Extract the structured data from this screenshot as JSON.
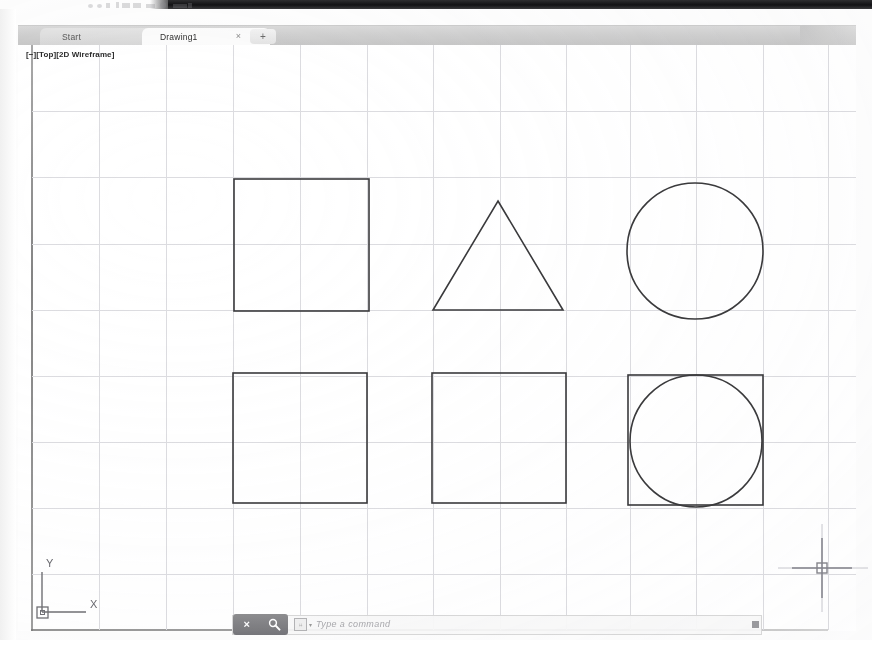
{
  "app": {
    "name": "AutoCAD",
    "viewport_label": "[−][Top][2D Wireframe]"
  },
  "tabs": {
    "start_label": "Start",
    "drawing_label": "Drawing1",
    "close_glyph": "×",
    "new_tab_glyph": "+"
  },
  "command_line": {
    "placeholder": "Type a command",
    "close_glyph": "×",
    "search_icon": "magnifier-wrench-icon",
    "prefix_icon_glyph": "⌗",
    "dropdown_glyph": "▾"
  },
  "ucs": {
    "x_label": "X",
    "y_label": "Y"
  },
  "colors": {
    "canvas_background": "#ffffff",
    "grid_line": "#dcdce0",
    "grid_line_major": "#cfcfd4",
    "shape_stroke": "#3a3a3c",
    "tabbar_background": "#cfcfcf",
    "active_tab_background": "#fbfbfb",
    "command_button_background": "#7b7b80",
    "scan_band": "#17171a",
    "ucs_stroke": "#6f6f74",
    "crosshair_stroke": "#9a9aa0"
  },
  "grid": {
    "vertical_x": [
      99,
      166,
      233,
      300,
      367,
      433,
      500,
      566,
      630,
      696,
      763,
      828
    ],
    "horizontal_y": [
      111,
      177,
      244,
      310,
      376,
      442,
      508,
      574
    ],
    "left": 32,
    "right": 856,
    "top": 45,
    "bottom": 630
  },
  "drawing": {
    "shapes": [
      {
        "name": "square-top-left",
        "type": "rect",
        "x": 234,
        "y": 179,
        "width": 135,
        "height": 132
      },
      {
        "name": "triangle-top-middle",
        "type": "polygon",
        "points": "498,201 563,310 433,310"
      },
      {
        "name": "circle-top-right",
        "type": "circle",
        "cx": 695,
        "cy": 251,
        "r": 68
      },
      {
        "name": "square-bottom-left",
        "type": "rect",
        "x": 233,
        "y": 373,
        "width": 134,
        "height": 130
      },
      {
        "name": "square-bottom-middle",
        "type": "rect",
        "x": 432,
        "y": 373,
        "width": 134,
        "height": 130
      },
      {
        "name": "square-bottom-right",
        "type": "rect",
        "x": 628,
        "y": 375,
        "width": 135,
        "height": 130
      },
      {
        "name": "circle-inscribed-bottom-right",
        "type": "circle",
        "cx": 696,
        "cy": 441,
        "r": 66
      }
    ]
  },
  "cursor": {
    "crosshair_x": 822,
    "crosshair_y": 568
  }
}
